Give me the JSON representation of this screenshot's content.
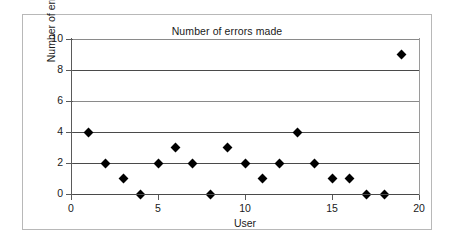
{
  "chart_data": {
    "type": "scatter",
    "title": "Number of errors made",
    "xlabel": "User",
    "ylabel": "Number of errors made",
    "xlim": [
      0,
      20
    ],
    "ylim": [
      0,
      10
    ],
    "xticks": [
      "0",
      "5",
      "10",
      "15",
      "20"
    ],
    "yticks": [
      "0",
      "2",
      "4",
      "6",
      "8",
      "10"
    ],
    "grid": "horizontal",
    "legend": "none",
    "marker": "diamond",
    "marker_color": "#000000",
    "x": [
      1,
      2,
      3,
      4,
      5,
      6,
      7,
      8,
      9,
      10,
      11,
      12,
      13,
      14,
      15,
      16,
      17,
      18,
      19
    ],
    "values": [
      4,
      2,
      1,
      0,
      2,
      3,
      2,
      0,
      3,
      2,
      1,
      2,
      4,
      2,
      1,
      1,
      0,
      0,
      9
    ],
    "points": [
      {
        "user": 1,
        "errors": 4
      },
      {
        "user": 2,
        "errors": 2
      },
      {
        "user": 3,
        "errors": 1
      },
      {
        "user": 4,
        "errors": 0
      },
      {
        "user": 5,
        "errors": 2
      },
      {
        "user": 6,
        "errors": 3
      },
      {
        "user": 7,
        "errors": 2
      },
      {
        "user": 8,
        "errors": 0
      },
      {
        "user": 9,
        "errors": 3
      },
      {
        "user": 10,
        "errors": 2
      },
      {
        "user": 11,
        "errors": 1
      },
      {
        "user": 12,
        "errors": 2
      },
      {
        "user": 13,
        "errors": 4
      },
      {
        "user": 14,
        "errors": 2
      },
      {
        "user": 15,
        "errors": 1
      },
      {
        "user": 16,
        "errors": 1
      },
      {
        "user": 17,
        "errors": 0
      },
      {
        "user": 18,
        "errors": 0
      },
      {
        "user": 19,
        "errors": 9
      }
    ]
  },
  "colors": {
    "frame_border": "#b8b8b8",
    "axis": "#4a4a4a",
    "gridline": "#4a4a4a",
    "text": "#1a1a1a",
    "background": "#ffffff"
  }
}
